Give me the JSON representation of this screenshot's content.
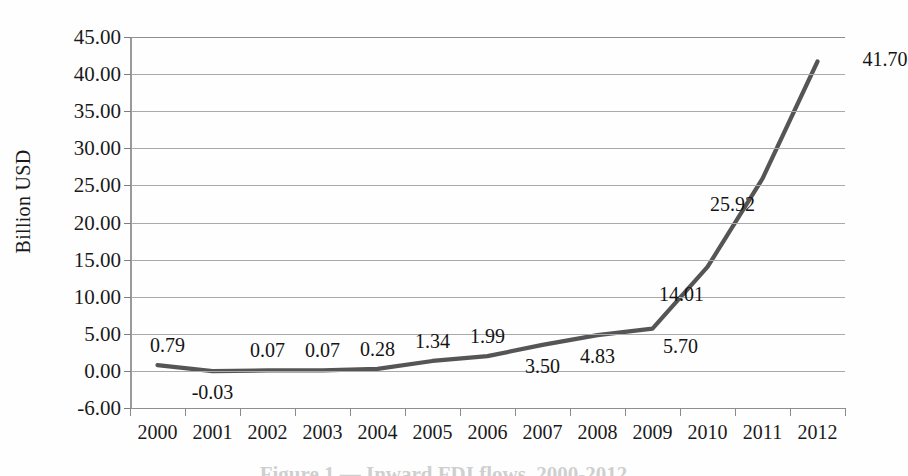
{
  "chart_data": {
    "type": "line",
    "title": "",
    "xlabel": "",
    "ylabel": "Billion USD",
    "categories": [
      "2000",
      "2001",
      "2002",
      "2003",
      "2004",
      "2005",
      "2006",
      "2007",
      "2008",
      "2009",
      "2010",
      "2011",
      "2012"
    ],
    "values": [
      0.79,
      -0.03,
      0.07,
      0.07,
      0.28,
      1.34,
      1.99,
      3.5,
      4.83,
      5.7,
      14.01,
      25.92,
      41.7
    ],
    "point_labels": [
      "0.79",
      "-0.03",
      "0.07",
      "0.07",
      "0.28",
      "1.34",
      "1.99",
      "3.50",
      "4.83",
      "5.70",
      "14.01",
      "25.92",
      "41.70"
    ],
    "label_positions": [
      "above",
      "below",
      "above",
      "above",
      "above",
      "above",
      "above",
      "below",
      "below",
      "below",
      "below",
      "below",
      "above"
    ],
    "ytick_labels": [
      "45.00",
      "40.00",
      "35.00",
      "30.00",
      "25.00",
      "20.00",
      "15.00",
      "10.00",
      "5.00",
      "0.00",
      "-6.00"
    ],
    "ytick_values": [
      45,
      40,
      35,
      30,
      25,
      20,
      15,
      10,
      5,
      0,
      -6
    ],
    "ylim": [
      -6,
      45
    ],
    "grid": "horizontal",
    "legend": "none",
    "line_color": "#555555",
    "gridline_color": "#a9a9a9",
    "axis_color": "#8a8a8a",
    "marker": "none"
  },
  "axis": {
    "y_title": "Billion USD"
  },
  "caption": {
    "text": "Figure 1 — Inward FDI flows, 2000-2012"
  }
}
